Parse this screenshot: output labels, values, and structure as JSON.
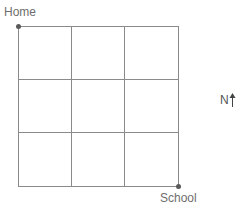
{
  "diagram": {
    "type": "grid-map",
    "rows": 3,
    "cols": 3,
    "start": {
      "label": "Home",
      "corner": "top-left"
    },
    "end": {
      "label": "School",
      "corner": "bottom-right"
    },
    "compass": {
      "label": "N",
      "direction": "up"
    },
    "colors": {
      "grid": "#8a8a8a",
      "dot": "#5a5a5a",
      "text": "#6e6e6e"
    }
  }
}
